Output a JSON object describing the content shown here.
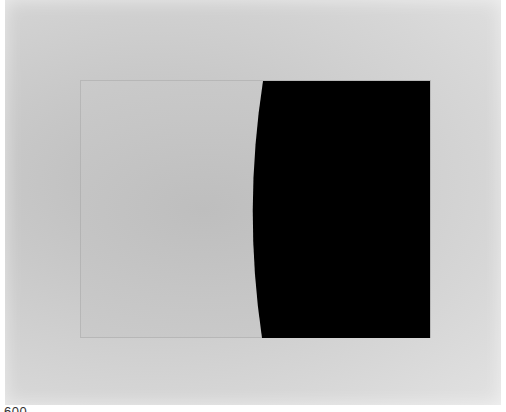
{
  "image": {
    "subject": "minimalist painting",
    "description": "Light gray canvas with an inset faint rectangle; a solid black shape on the right with a concave curved left edge",
    "colors": {
      "canvas": "#d2d2d2",
      "inner_panel": "#c6c6c6",
      "shape": "#000000"
    },
    "shape": {
      "top_left": [
        263,
        81
      ],
      "mid_left": [
        251,
        210
      ],
      "bottom_left": [
        262,
        338
      ],
      "right": 430
    }
  },
  "caption": {
    "fragment": "600"
  }
}
